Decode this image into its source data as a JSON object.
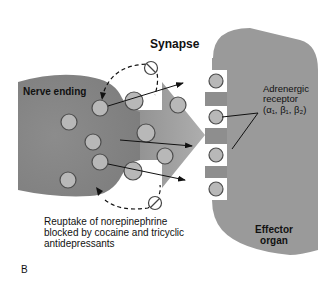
{
  "diagram": {
    "labels": {
      "synapse": "Synapse",
      "nerve_ending": "Nerve ending",
      "receptor_line1": "Adrenergic",
      "receptor_line2": "receptor",
      "receptor_line3": "(α₁, β₁, β₂)",
      "reuptake_line1": "Reuptake of norepinephrine",
      "reuptake_line2": "blocked by cocaine and tricyclic",
      "reuptake_line3": "antidepressants",
      "effector_line1": "Effector",
      "effector_line2": "organ",
      "panel_letter": "B"
    },
    "colors": {
      "nerve_fill": "#8a8a8a",
      "organ_fill": "#9a9a9a",
      "vesicle_fill": "#b5b5b5",
      "vesicle_stroke": "#555555",
      "arrow_fill": "#7d7d7d",
      "text": "#111111"
    },
    "icons": [
      "block-icon",
      "block-icon"
    ]
  }
}
